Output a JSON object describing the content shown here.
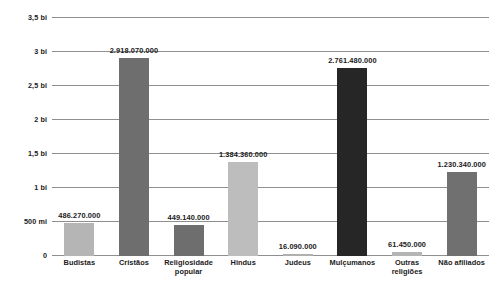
{
  "chart_data": {
    "type": "bar",
    "title": "",
    "subtitle": "",
    "xlabel": "",
    "ylabel": "",
    "ylim": [
      0,
      3500000000
    ],
    "grid": true,
    "legend": "none",
    "categories": [
      "Budistas",
      "Cristãos",
      "Religiosidade popular",
      "Hindus",
      "Judeus",
      "Mulçumanos",
      "Outras religiões",
      "Não afiliados"
    ],
    "values": [
      486270000,
      2918070000,
      449140000,
      1384360000,
      16090000,
      2761480000,
      61450000,
      1230340000
    ],
    "value_labels": [
      "486.270.000",
      "2.918.070.000",
      "449.140.000",
      "1.384.360.000",
      "16.090.000",
      "2.761.480.000",
      "61.450.000",
      "1.230.340.000"
    ],
    "bar_colors": [
      "#b5b5b5",
      "#6e6e6e",
      "#6e6e6e",
      "#bdbdbd",
      "#b0b0b0",
      "#262626",
      "#b5b5b5",
      "#707070"
    ],
    "yticks": [
      0,
      500000000,
      1000000000,
      1500000000,
      2000000000,
      2500000000,
      3000000000,
      3500000000
    ],
    "ytick_labels": [
      "0",
      "500 mi",
      "1 bi",
      "1,5 bi",
      "2 bi",
      "2,5 bi",
      "3 bi",
      "3,5 bi"
    ],
    "axis_color": "#8f8f8f",
    "text_color": "#1a1a1a",
    "background": "#ffffff"
  }
}
